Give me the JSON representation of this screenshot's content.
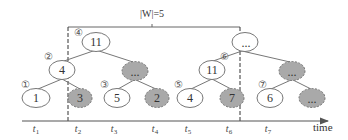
{
  "window": {
    "label": "|W|=5",
    "size": 5
  },
  "axis": {
    "label": "time",
    "ticks": [
      {
        "base": "t",
        "sub": "1"
      },
      {
        "base": "t",
        "sub": "2"
      },
      {
        "base": "t",
        "sub": "3"
      },
      {
        "base": "t",
        "sub": "4"
      },
      {
        "base": "t",
        "sub": "5"
      },
      {
        "base": "t",
        "sub": "6"
      },
      {
        "base": "t",
        "sub": "7"
      }
    ]
  },
  "steps": [
    "①",
    "②",
    "③",
    "④",
    "⑤",
    "⑥",
    "⑦"
  ],
  "trees": {
    "left": {
      "root": {
        "value": "11",
        "shaded": false
      },
      "left_child": {
        "value": "4",
        "shaded": false
      },
      "right_child": {
        "value": "...",
        "shaded": true
      },
      "leaves": [
        {
          "value": "1",
          "shaded": false
        },
        {
          "value": "3",
          "shaded": true
        },
        {
          "value": "5",
          "shaded": false
        },
        {
          "value": "2",
          "shaded": true
        }
      ]
    },
    "right": {
      "root": {
        "value": "...",
        "shaded": false
      },
      "left_child": {
        "value": "11",
        "shaded": false
      },
      "right_child": {
        "value": "...",
        "shaded": true
      },
      "leaves": [
        {
          "value": "4",
          "shaded": false
        },
        {
          "value": "7",
          "shaded": true
        },
        {
          "value": "6",
          "shaded": false
        },
        {
          "value": "...",
          "shaded": true
        }
      ]
    }
  },
  "colors": {
    "line": "#666666",
    "shaded_fill": "#a9a9a9",
    "node_stroke": "#777777"
  }
}
